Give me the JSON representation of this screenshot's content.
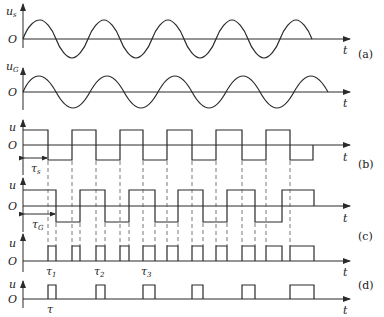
{
  "diagram": {
    "panels": [
      {
        "id": "a",
        "label": "(a)"
      },
      {
        "id": "b",
        "label": "(b)"
      },
      {
        "id": "c",
        "label": "(c)"
      },
      {
        "id": "d",
        "label": "(d)"
      }
    ],
    "axes": {
      "origin": "O",
      "time": "t",
      "us_main": "u",
      "us_sub": "s",
      "ug_main": "u",
      "ug_sub": "G",
      "u": "u"
    },
    "annotations": {
      "tau_s_main": "τ",
      "tau_s_sub": "s",
      "tau_g_main": "τ",
      "tau_g_sub": "G",
      "tau1_main": "τ",
      "tau1_sub": "1",
      "tau2_main": "τ",
      "tau2_sub": "2",
      "tau3_main": "τ",
      "tau3_sub": "3",
      "tau": "τ"
    },
    "square_wave_s_transitions_x": [
      48,
      72,
      96,
      120,
      143,
      167,
      192,
      216,
      242,
      266,
      290
    ],
    "square_wave_g_transitions_x": [
      56,
      80,
      105,
      129,
      155,
      178,
      203,
      227,
      255,
      282
    ],
    "pulses_c": [
      [
        48,
        56
      ],
      [
        72,
        80
      ],
      [
        96,
        105
      ],
      [
        120,
        129
      ],
      [
        143,
        155
      ],
      [
        167,
        178
      ],
      [
        192,
        203
      ],
      [
        216,
        227
      ],
      [
        242,
        255
      ],
      [
        266,
        282
      ],
      [
        290,
        314
      ]
    ],
    "pulses_d": [
      [
        48,
        56
      ],
      [
        96,
        105
      ],
      [
        143,
        155
      ],
      [
        192,
        203
      ],
      [
        242,
        255
      ],
      [
        290,
        314
      ]
    ]
  }
}
